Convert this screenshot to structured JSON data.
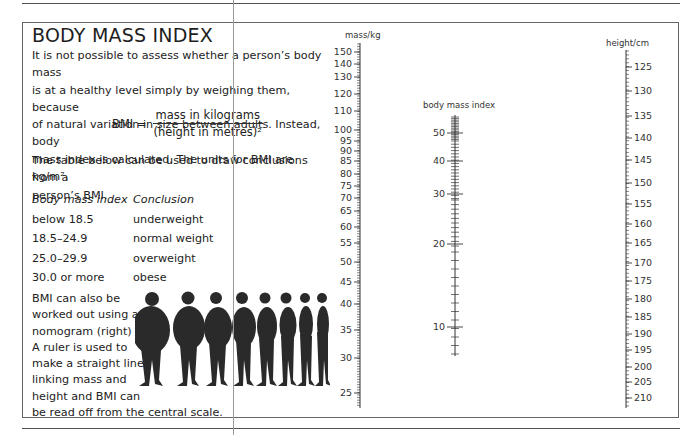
{
  "page": {
    "title": "BODY MASS INDEX",
    "intro": [
      "It is not possible to assess whether a person’s body mass",
      "is at a healthy level simply by weighing them, because",
      "of natural variation in size between adults. Instead, body",
      "mass index is calculated. The units for BMI are kg/m²."
    ],
    "formula": {
      "lhs": "BMI =",
      "numerator": "mass in kilograms",
      "denominator": "(height in metres)²"
    },
    "table_intro": [
      "The table below can be used to draw conclusions from a",
      "person’s BMI."
    ],
    "table": {
      "headers": [
        "Body mass index",
        "Conclusion"
      ],
      "rows": [
        [
          "below 18.5",
          "underweight"
        ],
        [
          "18.5–24.9",
          "normal weight"
        ],
        [
          "25.0–29.9",
          "overweight"
        ],
        [
          "30.0 or more",
          "obese"
        ]
      ]
    },
    "nomogram_text": [
      "BMI can also be",
      "worked out using a",
      "nomogram (right)",
      "A ruler is used to",
      "make a straight line",
      "linking mass and",
      "height and BMI can",
      "be read off from the central scale."
    ]
  },
  "chart_data": {
    "type": "nomogram",
    "axes": [
      {
        "name": "mass/kg",
        "ticks": [
          150,
          140,
          130,
          120,
          110,
          100,
          95,
          90,
          85,
          80,
          75,
          70,
          65,
          60,
          55,
          50,
          45,
          40,
          35,
          30,
          25
        ],
        "tick_y": [
          52,
          64,
          77,
          94,
          111,
          130,
          141,
          151,
          161,
          174,
          186,
          198,
          211,
          227,
          243,
          262,
          282,
          304,
          330,
          358,
          393
        ],
        "range": [
          23,
          155
        ],
        "label_side": "left"
      },
      {
        "name": "body mass index",
        "ticks": [
          50,
          40,
          30,
          20,
          10
        ],
        "tick_y": [
          133,
          161,
          194,
          244,
          327
        ],
        "range": [
          7,
          55
        ],
        "label_side": "left"
      },
      {
        "name": "height/cm",
        "ticks": [
          125,
          130,
          135,
          140,
          145,
          150,
          155,
          160,
          165,
          170,
          175,
          180,
          185,
          190,
          195,
          200,
          205,
          210
        ],
        "tick_y": [
          67,
          91,
          116,
          138,
          160,
          183,
          204,
          224,
          243,
          263,
          281,
          299,
          317,
          334,
          350,
          367,
          382,
          398
        ],
        "range": [
          122,
          212
        ],
        "label_side": "right"
      }
    ]
  }
}
